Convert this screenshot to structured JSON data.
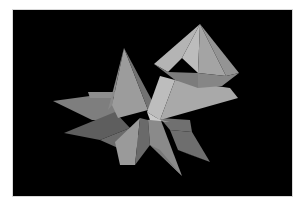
{
  "image": {
    "description": "3D rendering of gray faceted polyhedra (pyramids and an octahedral crystal with star-shaped spikes) on a black background",
    "background_color": "#000000",
    "border_color": "#ffffff",
    "shades": {
      "lightest": "#c2c2c2",
      "light": "#b2b2b2",
      "mid": "#9c9c9c",
      "midDark": "#858585",
      "dark": "#6c6c6c",
      "darkest": "#555555"
    }
  }
}
